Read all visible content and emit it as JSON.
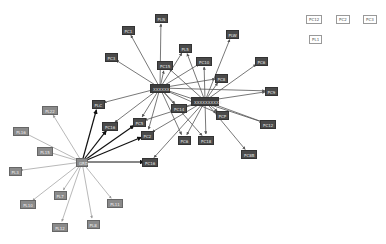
{
  "diagram": {
    "type": "directed network graph",
    "hubs": [
      {
        "id": "hubA",
        "label": "XXXXXX",
        "x": 160,
        "y": 88,
        "w": 20,
        "style": "hub"
      },
      {
        "id": "hubB",
        "label": "XXXXXXXXXX",
        "x": 205,
        "y": 101,
        "w": 28,
        "style": "hub"
      },
      {
        "id": "hubC",
        "label": "GRD",
        "x": 82,
        "y": 162,
        "w": 12,
        "style": "pl"
      }
    ],
    "nodes": [
      {
        "id": "n1",
        "label": "PLN",
        "x": 161,
        "y": 18,
        "style": "dark"
      },
      {
        "id": "n2",
        "label": "PC1",
        "x": 128,
        "y": 30,
        "style": "dark"
      },
      {
        "id": "n3",
        "label": "PC3",
        "x": 111,
        "y": 57,
        "style": "dark"
      },
      {
        "id": "n4",
        "label": "PL5",
        "x": 185,
        "y": 48,
        "style": "dark"
      },
      {
        "id": "n5",
        "label": "PC15",
        "x": 165,
        "y": 65,
        "style": "dark"
      },
      {
        "id": "n6",
        "label": "PLW",
        "x": 232,
        "y": 34,
        "style": "dark"
      },
      {
        "id": "n7",
        "label": "PC10",
        "x": 204,
        "y": 61,
        "style": "dark"
      },
      {
        "id": "n8",
        "label": "PC6",
        "x": 261,
        "y": 61,
        "style": "dark"
      },
      {
        "id": "n9",
        "label": "PC8",
        "x": 221,
        "y": 78,
        "style": "dark"
      },
      {
        "id": "n10",
        "label": "PC9",
        "x": 271,
        "y": 91,
        "style": "dark"
      },
      {
        "id": "n11",
        "label": "PLC",
        "x": 98,
        "y": 104,
        "style": "dark"
      },
      {
        "id": "n12",
        "label": "PC14",
        "x": 179,
        "y": 108,
        "style": "dark"
      },
      {
        "id": "n13",
        "label": "PC16",
        "x": 110,
        "y": 126,
        "style": "dark"
      },
      {
        "id": "n14",
        "label": "PC5",
        "x": 139,
        "y": 122,
        "style": "dark"
      },
      {
        "id": "n15",
        "label": "PCP",
        "x": 222,
        "y": 115,
        "style": "dark"
      },
      {
        "id": "n16",
        "label": "PC12",
        "x": 268,
        "y": 124,
        "style": "dark"
      },
      {
        "id": "n17",
        "label": "PC2",
        "x": 147,
        "y": 135,
        "style": "dark"
      },
      {
        "id": "n18",
        "label": "PC6",
        "x": 184,
        "y": 140,
        "style": "dark"
      },
      {
        "id": "n19",
        "label": "PC18",
        "x": 206,
        "y": 140,
        "style": "dark"
      },
      {
        "id": "n20",
        "label": "PC16",
        "x": 150,
        "y": 162,
        "style": "dark"
      },
      {
        "id": "n21",
        "label": "PC8B",
        "x": 249,
        "y": 154,
        "style": "dark"
      },
      {
        "id": "p1",
        "label": "PL22",
        "x": 50,
        "y": 110,
        "style": "pl"
      },
      {
        "id": "p2",
        "label": "PL16",
        "x": 21,
        "y": 131,
        "style": "pl"
      },
      {
        "id": "p3",
        "label": "PL15",
        "x": 45,
        "y": 151,
        "style": "pl"
      },
      {
        "id": "p4",
        "label": "PL3",
        "x": 15,
        "y": 171,
        "style": "pl"
      },
      {
        "id": "p5",
        "label": "PL7",
        "x": 60,
        "y": 195,
        "style": "pl"
      },
      {
        "id": "p6",
        "label": "PL10",
        "x": 28,
        "y": 204,
        "style": "pl"
      },
      {
        "id": "p7",
        "label": "PL11",
        "x": 115,
        "y": 203,
        "style": "pl"
      },
      {
        "id": "p8",
        "label": "PL8",
        "x": 93,
        "y": 224,
        "style": "pl"
      },
      {
        "id": "p9",
        "label": "PL12",
        "x": 60,
        "y": 227,
        "style": "pl"
      }
    ],
    "edges": [
      [
        "hubA",
        "n1"
      ],
      [
        "hubA",
        "n2"
      ],
      [
        "hubA",
        "n3"
      ],
      [
        "hubA",
        "n4"
      ],
      [
        "hubA",
        "n5"
      ],
      [
        "hubA",
        "n11"
      ],
      [
        "hubA",
        "n13"
      ],
      [
        "hubA",
        "n14"
      ],
      [
        "hubA",
        "n17"
      ],
      [
        "hubA",
        "n18"
      ],
      [
        "hubA",
        "n19"
      ],
      [
        "hubA",
        "n12"
      ],
      [
        "hubA",
        "n15"
      ],
      [
        "hubA",
        "n16"
      ],
      [
        "hubA",
        "n10"
      ],
      [
        "hubA",
        "n7"
      ],
      [
        "hubA",
        "n9"
      ],
      [
        "hubB",
        "n4"
      ],
      [
        "hubB",
        "n6"
      ],
      [
        "hubB",
        "n7"
      ],
      [
        "hubB",
        "n8"
      ],
      [
        "hubB",
        "n9"
      ],
      [
        "hubB",
        "n10"
      ],
      [
        "hubB",
        "n12"
      ],
      [
        "hubB",
        "n14"
      ],
      [
        "hubB",
        "n15"
      ],
      [
        "hubB",
        "n16"
      ],
      [
        "hubB",
        "n17"
      ],
      [
        "hubB",
        "n18"
      ],
      [
        "hubB",
        "n19"
      ],
      [
        "hubB",
        "n21"
      ],
      [
        "hubB",
        "n20"
      ],
      [
        "hubB",
        "n5"
      ],
      [
        "hubC",
        "n11"
      ],
      [
        "hubC",
        "n13"
      ],
      [
        "hubC",
        "n14"
      ],
      [
        "hubC",
        "n17"
      ],
      [
        "hubC",
        "n20"
      ],
      [
        "hubC",
        "p1"
      ],
      [
        "hubC",
        "p2"
      ],
      [
        "hubC",
        "p3"
      ],
      [
        "hubC",
        "p4"
      ],
      [
        "hubC",
        "p5"
      ],
      [
        "hubC",
        "p6"
      ],
      [
        "hubC",
        "p7"
      ],
      [
        "hubC",
        "p8"
      ],
      [
        "hubC",
        "p9"
      ]
    ],
    "colors": {
      "edge_dark": "#555555",
      "edge_bold": "#111111",
      "edge_light": "#9a9a9a",
      "node_dark": "#4a4a4a",
      "node_light": "#8a8a8a"
    }
  },
  "legend": {
    "items": [
      {
        "label": "PC12",
        "x": 306,
        "y": 15
      },
      {
        "label": "PC2",
        "x": 336,
        "y": 15
      },
      {
        "label": "PC3",
        "x": 363,
        "y": 15
      },
      {
        "label": "PL1",
        "x": 309,
        "y": 35
      }
    ]
  }
}
